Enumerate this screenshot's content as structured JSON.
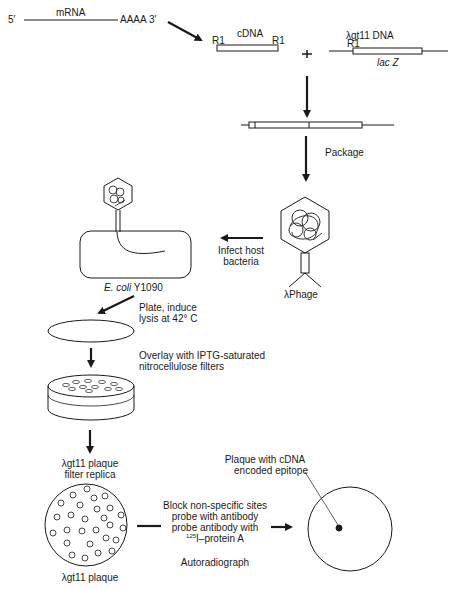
{
  "labels": {
    "five_prime": "5′",
    "mrna": "mRNA",
    "poly_a": "AAAA 3′",
    "cdna": "cDNA",
    "r1_left": "R1",
    "r1_right": "R1",
    "plus": "+",
    "lambda_dna": "λgt11 DNA",
    "r1_vector": "R1",
    "lacz": "lac Z",
    "package": "Package",
    "infect_line1": "Infect host",
    "infect_line2": "bacteria",
    "phage": "λPhage",
    "ecoli_italic": "E. coli",
    "ecoli_strain": "Y1090",
    "plate_line1": "Plate, induce",
    "plate_line2": "lysis at 42° C",
    "overlay_line1": "Overlay with IPTG-saturated",
    "overlay_line2": "nitrocellulose filters",
    "replica_line1": "λgt11 plaque",
    "replica_line2": "filter replica",
    "plaque_bottom": "λgt11 plaque",
    "block_line1": "Block non-specific sites",
    "block_line2": "probe with antibody",
    "block_line3": "probe antibody with",
    "block_line4_sup": "125",
    "block_line4": "I–protein A",
    "autoradiograph": "Autoradiograph",
    "epitope_line1": "Plaque with cDNA",
    "epitope_line2": "encoded epitope"
  },
  "colors": {
    "ink": "#1a1a1a",
    "background": "#ffffff"
  }
}
